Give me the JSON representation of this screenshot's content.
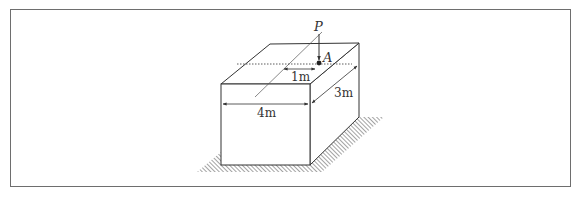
{
  "figure": {
    "labels": {
      "load": "P",
      "point": "A",
      "offset": "1m",
      "width": "4m",
      "depth": "3m"
    },
    "colors": {
      "line": "#333333",
      "frame": "#6e6e6e",
      "hatch": "#555555"
    }
  }
}
